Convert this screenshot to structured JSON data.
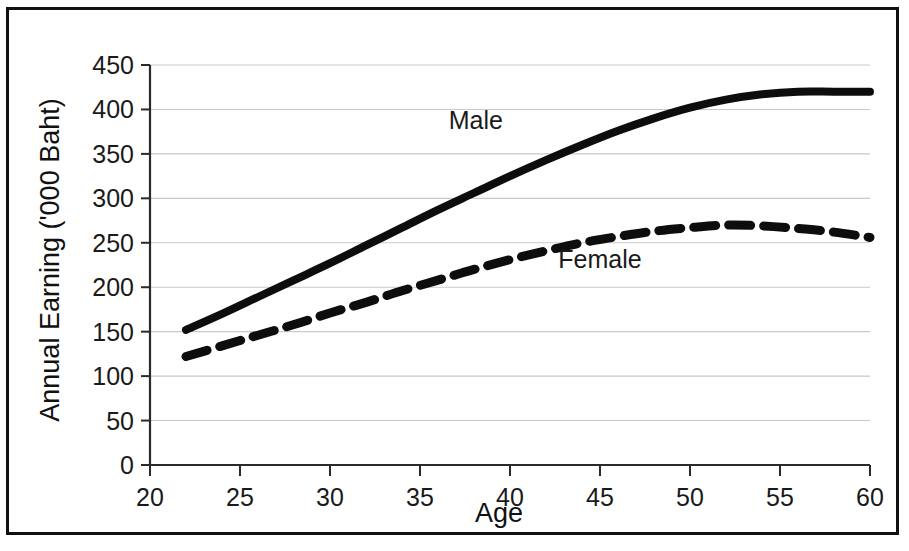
{
  "chart_data": {
    "type": "line",
    "title": "",
    "xlabel": "Age",
    "ylabel": "Annual Earning ('000 Baht)",
    "xlim": [
      20,
      60
    ],
    "ylim": [
      0,
      450
    ],
    "xticks": [
      20,
      25,
      30,
      35,
      40,
      45,
      50,
      55,
      60
    ],
    "xtick_labels": [
      "20",
      "25",
      "30",
      "35",
      "40",
      "45",
      "50",
      "55",
      "60"
    ],
    "yticks": [
      0,
      50,
      100,
      150,
      200,
      250,
      300,
      350,
      400,
      450
    ],
    "ytick_labels": [
      "0",
      "50",
      "100",
      "150",
      "200",
      "250",
      "300",
      "350",
      "400",
      "450"
    ],
    "grid": "horizontal",
    "legend_position": "inline-annotation",
    "x": [
      22,
      24,
      26,
      28,
      30,
      32,
      34,
      36,
      38,
      40,
      42,
      44,
      46,
      48,
      50,
      52,
      54,
      56,
      58,
      60
    ],
    "series": [
      {
        "name": "Male",
        "style": "solid",
        "color": "#0d0d0d",
        "values": [
          152,
          170,
          189,
          208,
          227,
          247,
          267,
          287,
          306,
          325,
          343,
          360,
          376,
          390,
          402,
          411,
          417,
          420,
          420,
          420
        ]
      },
      {
        "name": "Female",
        "style": "dashed",
        "color": "#0d0d0d",
        "values": [
          122,
          134,
          146,
          158,
          171,
          183,
          196,
          208,
          220,
          231,
          241,
          250,
          257,
          263,
          267,
          270,
          269,
          266,
          262,
          256
        ]
      }
    ],
    "annotations": [
      {
        "text": "Male",
        "x": 38.1,
        "y": 378
      },
      {
        "text": "Female",
        "x": 45.0,
        "y": 222
      }
    ]
  },
  "figure": {
    "border_color": "#111111",
    "grid_color": "#c9c9c9",
    "axis_color": "#2a2a2a",
    "background": "#ffffff"
  }
}
